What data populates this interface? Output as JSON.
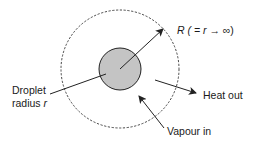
{
  "diagram": {
    "type": "droplet-evaporation-schematic",
    "colors": {
      "droplet_fill": "#c4c4c4",
      "stroke": "#222222",
      "background": "#ffffff"
    },
    "labels": {
      "outer_radius": {
        "prefix": "R ( = ",
        "var": "r",
        "arrow": " → ",
        "suffix": "∞)"
      },
      "droplet": {
        "line1": "Droplet",
        "line2_prefix": "radius ",
        "line2_var": "r"
      },
      "heat_out": "Heat out",
      "vapour_in": "Vapour in"
    },
    "shapes": {
      "droplet": {
        "cx": 120,
        "cy": 69,
        "r": 21
      },
      "boundary": {
        "cx": 120,
        "cy": 69,
        "r": 59,
        "style": "dashed"
      }
    }
  }
}
